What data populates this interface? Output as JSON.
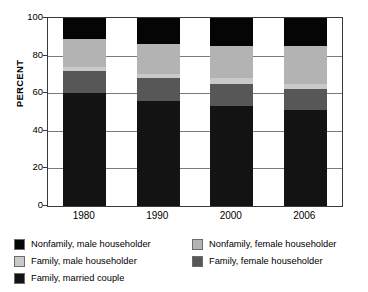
{
  "chart_data": {
    "type": "bar",
    "subtype": "stacked-bar-100-percent",
    "title": "",
    "xlabel": "",
    "ylabel": "PERCENT",
    "ylim": [
      0,
      100
    ],
    "yticks": [
      0,
      20,
      40,
      60,
      80,
      100
    ],
    "ytick_labels": [
      "0",
      "20",
      "40",
      "60",
      "80",
      "100"
    ],
    "grid": true,
    "grid_axis": "y",
    "legend_position": "below",
    "stack_order_bottom_to_top": [
      "Family, married couple",
      "Family, female householder",
      "Family, male householder",
      "Nonfamily, female householder",
      "Nonfamily, male householder"
    ],
    "categories": [
      "1980",
      "1990",
      "2000",
      "2006"
    ],
    "series": [
      {
        "name": "Family, married couple",
        "key": "family_married_couple",
        "color": "#131313",
        "values": [
          60,
          56,
          53,
          51
        ]
      },
      {
        "name": "Family, female householder",
        "key": "family_female_householder",
        "color": "#575757",
        "values": [
          12,
          12,
          12,
          11
        ]
      },
      {
        "name": "Family, male householder",
        "key": "family_male_householder",
        "color": "#c9c9c9",
        "values": [
          2,
          2,
          3,
          3
        ]
      },
      {
        "name": "Nonfamily, female householder",
        "key": "nonfamily_female_householder",
        "color": "#b3b3b3",
        "values": [
          15,
          16,
          17,
          20
        ]
      },
      {
        "name": "Nonfamily, male householder",
        "key": "nonfamily_male_householder",
        "color": "#050505",
        "values": [
          11,
          14,
          15,
          15
        ]
      }
    ]
  },
  "axes": {
    "y_title": "PERCENT"
  },
  "legend": {
    "rows": [
      [
        {
          "label": "Nonfamily, male householder",
          "color": "#050505",
          "swatch": "nonfamily-male-swatch"
        },
        {
          "label": "Nonfamily, female householder",
          "color": "#b3b3b3",
          "swatch": "nonfamily-female-swatch"
        }
      ],
      [
        {
          "label": "Family, male householder",
          "color": "#c9c9c9",
          "swatch": "family-male-swatch"
        },
        {
          "label": "Family, female householder",
          "color": "#575757",
          "swatch": "family-female-swatch"
        }
      ],
      [
        {
          "label": "Family, married couple",
          "color": "#131313",
          "swatch": "family-married-swatch"
        }
      ]
    ]
  }
}
